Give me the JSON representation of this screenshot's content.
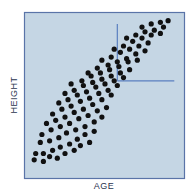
{
  "chart_data": {
    "type": "scatter",
    "title": "",
    "xlabel": "AGE",
    "ylabel": "HEIGHT",
    "grid": false,
    "legend": null,
    "axis_ticks": "none",
    "xlim": [
      0,
      100
    ],
    "ylim": [
      0,
      100
    ],
    "reference_lines": [
      {
        "orientation": "vertical",
        "x": 58,
        "y_from": 59,
        "y_to": 95
      },
      {
        "orientation": "horizontal",
        "y": 59,
        "x_from": 58,
        "x_to": 95
      }
    ],
    "points": [
      [
        4,
        9
      ],
      [
        10,
        8
      ],
      [
        14,
        11
      ],
      [
        19,
        10
      ],
      [
        24,
        13
      ],
      [
        30,
        15
      ],
      [
        34,
        18
      ],
      [
        40,
        20
      ],
      [
        5,
        13
      ],
      [
        10,
        13
      ],
      [
        16,
        15
      ],
      [
        21,
        17
      ],
      [
        27,
        19
      ],
      [
        32,
        22
      ],
      [
        37,
        25
      ],
      [
        43,
        27
      ],
      [
        8,
        20
      ],
      [
        14,
        21
      ],
      [
        20,
        23
      ],
      [
        25,
        26
      ],
      [
        31,
        28
      ],
      [
        37,
        30
      ],
      [
        43,
        33
      ],
      [
        48,
        36
      ],
      [
        9,
        25
      ],
      [
        15,
        28
      ],
      [
        21,
        30
      ],
      [
        27,
        32
      ],
      [
        33,
        35
      ],
      [
        39,
        37
      ],
      [
        45,
        40
      ],
      [
        51,
        42
      ],
      [
        12,
        32
      ],
      [
        18,
        34
      ],
      [
        24,
        36
      ],
      [
        30,
        39
      ],
      [
        36,
        41
      ],
      [
        42,
        44
      ],
      [
        48,
        47
      ],
      [
        54,
        50
      ],
      [
        16,
        38
      ],
      [
        22,
        41
      ],
      [
        28,
        43
      ],
      [
        34,
        46
      ],
      [
        40,
        48
      ],
      [
        46,
        51
      ],
      [
        52,
        53
      ],
      [
        58,
        56
      ],
      [
        20,
        45
      ],
      [
        26,
        47
      ],
      [
        32,
        50
      ],
      [
        38,
        52
      ],
      [
        44,
        55
      ],
      [
        50,
        57
      ],
      [
        56,
        59
      ],
      [
        62,
        61
      ],
      [
        24,
        51
      ],
      [
        30,
        53
      ],
      [
        36,
        56
      ],
      [
        42,
        58
      ],
      [
        48,
        60
      ],
      [
        54,
        62
      ],
      [
        60,
        64
      ],
      [
        66,
        66
      ],
      [
        28,
        57
      ],
      [
        35,
        59
      ],
      [
        41,
        62
      ],
      [
        47,
        64
      ],
      [
        53,
        66
      ],
      [
        59,
        68
      ],
      [
        65,
        71
      ],
      [
        71,
        72
      ],
      [
        39,
        64
      ],
      [
        45,
        67
      ],
      [
        52,
        69
      ],
      [
        58,
        71
      ],
      [
        64,
        73
      ],
      [
        70,
        76
      ],
      [
        76,
        78
      ],
      [
        48,
        72
      ],
      [
        54,
        74
      ],
      [
        60,
        77
      ],
      [
        66,
        79
      ],
      [
        72,
        81
      ],
      [
        78,
        83
      ],
      [
        56,
        79
      ],
      [
        62,
        81
      ],
      [
        68,
        84
      ],
      [
        74,
        86
      ],
      [
        80,
        88
      ],
      [
        86,
        89
      ],
      [
        64,
        86
      ],
      [
        70,
        88
      ],
      [
        76,
        90
      ],
      [
        82,
        91
      ],
      [
        88,
        93
      ],
      [
        74,
        93
      ],
      [
        80,
        95
      ],
      [
        86,
        96
      ],
      [
        91,
        97
      ]
    ]
  },
  "labels": {
    "x": "AGE",
    "y": "HEIGHT"
  },
  "colors": {
    "plot_background": "#c5d6e4",
    "frame": "#5a74a8",
    "reference_line": "#5a7fc0",
    "points": "#111111",
    "label_text": "#2a3550"
  }
}
